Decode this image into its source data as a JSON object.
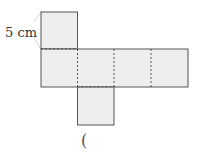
{
  "diagram": {
    "type": "cube-net",
    "side_label": "5 cm",
    "answer_paren": "(",
    "colors": {
      "face_fill": "#eeeeee",
      "edge": "#555555",
      "fold": "#555555"
    }
  }
}
